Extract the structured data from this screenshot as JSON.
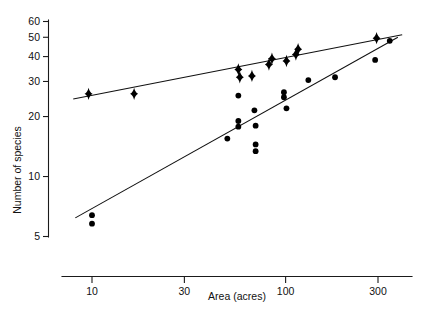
{
  "figure": {
    "background_color": "#ffffff",
    "ink_color": "#000000"
  },
  "axes": {
    "x": {
      "label": "Area (acres)",
      "scale": "log",
      "ticks": [
        10,
        30,
        100,
        300
      ],
      "tick_labels": [
        "10",
        "30",
        "100",
        "300"
      ],
      "range": [
        7.0,
        420.0
      ]
    },
    "y": {
      "label": "Number of species",
      "scale": "log",
      "ticks": [
        5,
        10,
        20,
        30,
        40,
        50,
        60
      ],
      "tick_labels": [
        "5",
        "10",
        "20",
        "30",
        "40",
        "50",
        "60"
      ],
      "range": [
        4.6,
        62.0
      ]
    }
  },
  "chart_data": {
    "type": "scatter",
    "title": "",
    "xlabel": "Area (acres)",
    "ylabel": "Number of species",
    "xscale": "log",
    "yscale": "log",
    "xlim": [
      7.0,
      420.0
    ],
    "ylim": [
      4.6,
      62.0
    ],
    "grid": false,
    "legend": "none",
    "xticks": [
      10,
      30,
      100,
      300
    ],
    "yticks": [
      5,
      10,
      20,
      30,
      40,
      50,
      60
    ],
    "series": [
      {
        "name": "upper-series-diamonds",
        "marker": "diamond",
        "color": "#000000",
        "points": [
          {
            "x": 9.6,
            "y": 26.0
          },
          {
            "x": 16.5,
            "y": 26.0
          },
          {
            "x": 57.0,
            "y": 34.5
          },
          {
            "x": 58.0,
            "y": 31.5
          },
          {
            "x": 67.0,
            "y": 32.0
          },
          {
            "x": 82.0,
            "y": 36.5
          },
          {
            "x": 85.0,
            "y": 39.0
          },
          {
            "x": 101.0,
            "y": 38.0
          },
          {
            "x": 113.0,
            "y": 41.0
          },
          {
            "x": 116.0,
            "y": 43.5
          },
          {
            "x": 295.0,
            "y": 49.5
          }
        ]
      },
      {
        "name": "lower-series-circles",
        "marker": "circle",
        "color": "#000000",
        "points": [
          {
            "x": 10.0,
            "y": 6.4
          },
          {
            "x": 10.0,
            "y": 5.8
          },
          {
            "x": 50.0,
            "y": 15.5
          },
          {
            "x": 57.0,
            "y": 19.0
          },
          {
            "x": 57.0,
            "y": 17.8
          },
          {
            "x": 57.0,
            "y": 25.5
          },
          {
            "x": 69.0,
            "y": 21.5
          },
          {
            "x": 70.0,
            "y": 18.0
          },
          {
            "x": 70.0,
            "y": 14.5
          },
          {
            "x": 70.0,
            "y": 13.4
          },
          {
            "x": 98.0,
            "y": 26.5
          },
          {
            "x": 98.0,
            "y": 25.0
          },
          {
            "x": 101.0,
            "y": 22.0
          },
          {
            "x": 131.0,
            "y": 30.5
          },
          {
            "x": 180.0,
            "y": 31.5
          },
          {
            "x": 290.0,
            "y": 38.5
          },
          {
            "x": 345.0,
            "y": 48.0
          }
        ]
      }
    ],
    "fit_lines": [
      {
        "name": "upper-regression-line",
        "for_series": "upper-series-diamonds",
        "x_start": 8.0,
        "y_start": 24.5,
        "x_end": 400.0,
        "y_end": 51.5
      },
      {
        "name": "lower-regression-line",
        "for_series": "lower-series-circles",
        "x_start": 8.2,
        "y_start": 6.2,
        "x_end": 380.0,
        "y_end": 50.0
      }
    ]
  }
}
